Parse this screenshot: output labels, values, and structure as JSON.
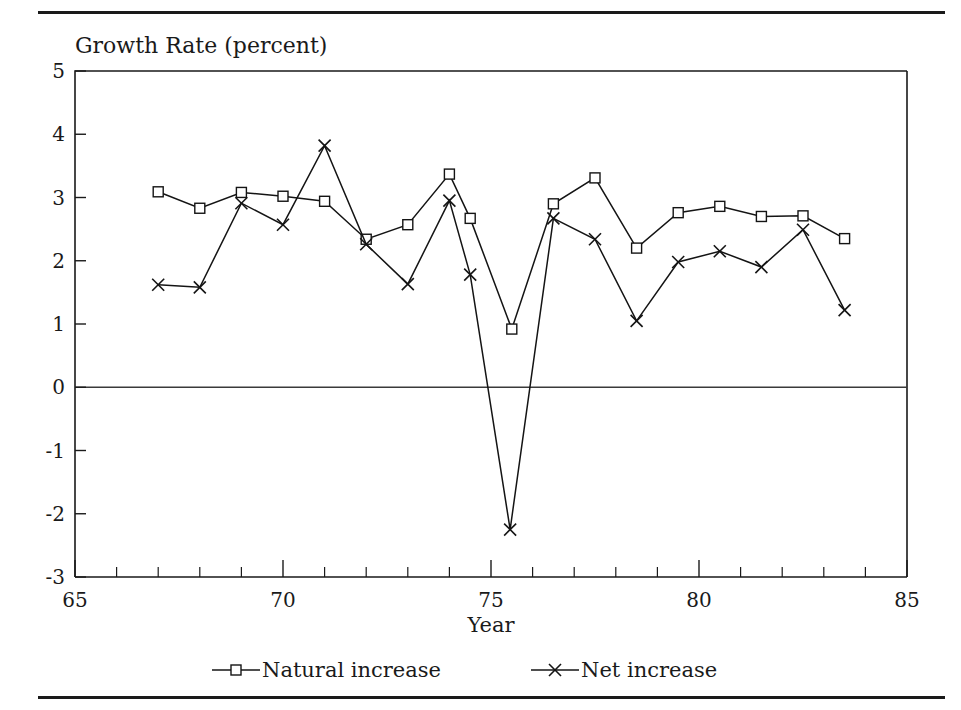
{
  "chart_data": {
    "type": "line",
    "title": "Growth Rate (percent)",
    "xlabel": "Year",
    "ylabel": "",
    "xlim": [
      65,
      85
    ],
    "ylim": [
      -3,
      5
    ],
    "x_ticks_major": [
      65,
      70,
      75,
      80,
      85
    ],
    "x_ticks_minor": [
      66,
      67,
      68,
      69,
      71,
      72,
      73,
      74,
      76,
      77,
      78,
      79,
      81,
      82,
      83,
      84
    ],
    "y_ticks": [
      5,
      4,
      3,
      2,
      1,
      0,
      -1,
      -2,
      -3
    ],
    "grid": false,
    "zero_line": true,
    "legend_position": "bottom",
    "series": [
      {
        "name": "Natural increase",
        "marker": "square",
        "x": [
          67.0,
          68.0,
          69.0,
          70.0,
          71.0,
          72.0,
          73.0,
          74.0,
          74.5,
          75.5,
          76.5,
          77.5,
          78.5,
          79.5,
          80.5,
          81.5,
          82.5,
          83.5
        ],
        "values": [
          3.09,
          2.83,
          3.08,
          3.02,
          2.94,
          2.34,
          2.57,
          3.37,
          2.67,
          0.92,
          2.9,
          3.31,
          2.2,
          2.76,
          2.86,
          2.7,
          2.71,
          2.35
        ]
      },
      {
        "name": "Net increase",
        "marker": "x",
        "x": [
          67.0,
          68.0,
          69.0,
          70.0,
          71.0,
          72.0,
          73.0,
          74.0,
          74.5,
          75.46,
          76.5,
          77.5,
          78.5,
          79.5,
          80.5,
          81.5,
          82.5,
          83.5
        ],
        "values": [
          1.62,
          1.58,
          2.91,
          2.57,
          3.82,
          2.26,
          1.63,
          2.95,
          1.78,
          -2.25,
          2.67,
          2.34,
          1.05,
          1.98,
          2.15,
          1.9,
          2.49,
          1.22
        ]
      }
    ]
  },
  "legend": {
    "items": [
      {
        "label": "Natural increase",
        "marker": "square"
      },
      {
        "label": "Net increase",
        "marker": "x"
      }
    ]
  },
  "colors": {
    "ink": "#141414",
    "rule": "#1a1a1a",
    "background": "#ffffff"
  }
}
